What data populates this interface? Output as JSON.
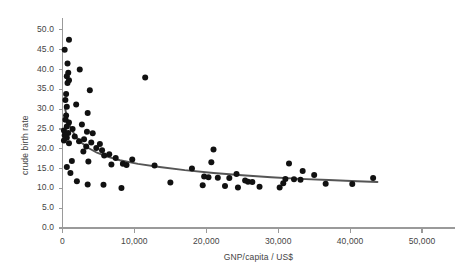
{
  "chart_data": {
    "type": "scatter",
    "title": "",
    "xlabel": "GNP/capita / US$",
    "ylabel": "crude birth rate",
    "xlim": [
      0,
      52500
    ],
    "ylim": [
      0,
      52
    ],
    "grid": false,
    "legend": "none",
    "point_color": "#111111",
    "trend_color": "#555555",
    "axis_color": "#9a9a9a",
    "text_color": "#444444",
    "xticks": [
      0,
      10000,
      20000,
      30000,
      40000,
      50000
    ],
    "xtick_labels": [
      "0",
      "10,000",
      "20,000",
      "30,000",
      "40,000",
      "50,000"
    ],
    "yticks": [
      0,
      5,
      10,
      15,
      20,
      25,
      30,
      35,
      40,
      45,
      50
    ],
    "ytick_labels": [
      "0.0",
      "5.0",
      "10.0",
      "15.0",
      "20.0",
      "25.0",
      "30.0",
      "35.0",
      "40.0",
      "45.0",
      "50.0"
    ],
    "points": [
      [
        900,
        47.5
      ],
      [
        300,
        45.0
      ],
      [
        700,
        41.5
      ],
      [
        2400,
        40.0
      ],
      [
        800,
        39.2
      ],
      [
        600,
        38.3
      ],
      [
        11500,
        38.0
      ],
      [
        900,
        37.3
      ],
      [
        700,
        36.6
      ],
      [
        3800,
        34.8
      ],
      [
        500,
        33.8
      ],
      [
        400,
        32.3
      ],
      [
        1900,
        31.2
      ],
      [
        600,
        30.6
      ],
      [
        3500,
        29.0
      ],
      [
        500,
        28.4
      ],
      [
        400,
        27.3
      ],
      [
        900,
        26.6
      ],
      [
        2700,
        26.1
      ],
      [
        600,
        25.6
      ],
      [
        1400,
        25.0
      ],
      [
        200,
        24.6
      ],
      [
        3400,
        24.3
      ],
      [
        800,
        24.0
      ],
      [
        4200,
        23.9
      ],
      [
        300,
        23.4
      ],
      [
        1700,
        23.1
      ],
      [
        600,
        22.8
      ],
      [
        3000,
        22.4
      ],
      [
        200,
        22.1
      ],
      [
        2300,
        21.9
      ],
      [
        4000,
        21.6
      ],
      [
        900,
        21.4
      ],
      [
        5200,
        21.2
      ],
      [
        3300,
        20.6
      ],
      [
        4700,
        20.2
      ],
      [
        5500,
        19.6
      ],
      [
        21000,
        19.8
      ],
      [
        2900,
        19.3
      ],
      [
        6500,
        18.6
      ],
      [
        5800,
        18.3
      ],
      [
        7400,
        17.7
      ],
      [
        9700,
        17.3
      ],
      [
        1300,
        16.9
      ],
      [
        3600,
        16.8
      ],
      [
        20700,
        16.6
      ],
      [
        8400,
        16.2
      ],
      [
        31500,
        16.3
      ],
      [
        6800,
        16.0
      ],
      [
        8900,
        15.9
      ],
      [
        12800,
        15.8
      ],
      [
        600,
        15.4
      ],
      [
        18000,
        15.0
      ],
      [
        33400,
        14.4
      ],
      [
        1100,
        13.9
      ],
      [
        24200,
        13.6
      ],
      [
        35000,
        13.4
      ],
      [
        19700,
        13.0
      ],
      [
        20300,
        12.8
      ],
      [
        21600,
        12.7
      ],
      [
        23200,
        12.6
      ],
      [
        43200,
        12.6
      ],
      [
        31000,
        12.4
      ],
      [
        32200,
        12.3
      ],
      [
        33100,
        12.2
      ],
      [
        25400,
        12.0
      ],
      [
        2000,
        11.8
      ],
      [
        25800,
        11.7
      ],
      [
        26400,
        11.6
      ],
      [
        15000,
        11.5
      ],
      [
        30700,
        11.3
      ],
      [
        36600,
        11.2
      ],
      [
        40300,
        11.1
      ],
      [
        3500,
        11.0
      ],
      [
        5700,
        10.9
      ],
      [
        19500,
        10.8
      ],
      [
        22600,
        10.6
      ],
      [
        27400,
        10.4
      ],
      [
        24400,
        10.2
      ],
      [
        30200,
        10.2
      ],
      [
        8200,
        10.1
      ]
    ],
    "trend_line": {
      "description": "fitted decaying curve through the scatter",
      "points": [
        [
          320,
          30.5
        ],
        [
          700,
          27.4
        ],
        [
          1200,
          25.0
        ],
        [
          1800,
          23.2
        ],
        [
          2600,
          21.6
        ],
        [
          3600,
          20.2
        ],
        [
          4800,
          19.0
        ],
        [
          6200,
          18.0
        ],
        [
          8000,
          17.1
        ],
        [
          10500,
          16.2
        ],
        [
          13500,
          15.4
        ],
        [
          17000,
          14.6
        ],
        [
          21000,
          13.9
        ],
        [
          25000,
          13.3
        ],
        [
          29000,
          12.8
        ],
        [
          33000,
          12.4
        ],
        [
          37000,
          12.1
        ],
        [
          41000,
          11.8
        ],
        [
          43800,
          11.6
        ]
      ]
    }
  }
}
